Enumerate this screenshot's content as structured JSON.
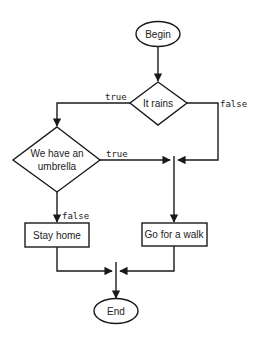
{
  "diagram": {
    "type": "flowchart",
    "nodes": {
      "begin": {
        "label": "Begin",
        "shape": "ellipse"
      },
      "it_rains": {
        "label": "It rains",
        "shape": "diamond"
      },
      "umbrella": {
        "line1": "We have an",
        "line2": "umbrella",
        "shape": "diamond"
      },
      "stay_home": {
        "label": "Stay home",
        "shape": "rectangle"
      },
      "walk": {
        "label": "Go for a walk",
        "shape": "rectangle"
      },
      "end": {
        "label": "End",
        "shape": "ellipse"
      }
    },
    "edges": {
      "rains_true": "true",
      "rains_false": "false",
      "umbrella_true": "true",
      "umbrella_false": "false"
    },
    "colors": {
      "stroke": "#1a1a1a",
      "fill": "#ffffff",
      "text": "#222222"
    }
  }
}
